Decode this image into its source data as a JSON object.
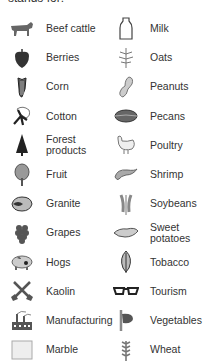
{
  "heading": "stands for:",
  "left": [
    {
      "label": "Beef cattle",
      "icon": "cow-icon"
    },
    {
      "label": "Berries",
      "icon": "berry-icon"
    },
    {
      "label": "Corn",
      "icon": "corn-icon"
    },
    {
      "label": "Cotton",
      "icon": "cotton-icon"
    },
    {
      "label": "Forest products",
      "icon": "tree-icon"
    },
    {
      "label": "Fruit",
      "icon": "fruit-tree-icon"
    },
    {
      "label": "Granite",
      "icon": "granite-icon"
    },
    {
      "label": "Grapes",
      "icon": "grapes-icon"
    },
    {
      "label": "Hogs",
      "icon": "pig-icon"
    },
    {
      "label": "Kaolin",
      "icon": "shovels-icon"
    },
    {
      "label": "Manufacturing",
      "icon": "factory-icon"
    },
    {
      "label": "Marble",
      "icon": "marble-block-icon"
    }
  ],
  "right": [
    {
      "label": "Milk",
      "icon": "milk-bottle-icon"
    },
    {
      "label": "Oats",
      "icon": "oats-icon"
    },
    {
      "label": "Peanuts",
      "icon": "peanut-icon"
    },
    {
      "label": "Pecans",
      "icon": "pecan-icon"
    },
    {
      "label": "Poultry",
      "icon": "chicken-icon"
    },
    {
      "label": "Shrimp",
      "icon": "shrimp-icon"
    },
    {
      "label": "Soybeans",
      "icon": "soybean-icon"
    },
    {
      "label": "Sweet potatoes",
      "icon": "sweet-potato-icon"
    },
    {
      "label": "Tobacco",
      "icon": "tobacco-leaf-icon"
    },
    {
      "label": "Tourism",
      "icon": "sunglasses-icon"
    },
    {
      "label": "Vegetables",
      "icon": "vegetables-icon"
    },
    {
      "label": "Wheat",
      "icon": "wheat-icon"
    }
  ]
}
